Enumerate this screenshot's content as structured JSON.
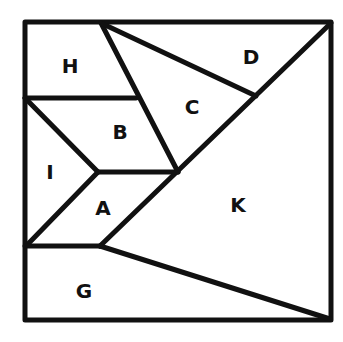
{
  "diagram": {
    "type": "dissection-puzzle",
    "colors": {
      "line": "#111111",
      "background": "#ffffff"
    },
    "regions": [
      {
        "id": "H",
        "label": "H",
        "x": 70,
        "y": 74
      },
      {
        "id": "D",
        "label": "D",
        "x": 251,
        "y": 64
      },
      {
        "id": "C",
        "label": "C",
        "x": 192,
        "y": 115
      },
      {
        "id": "B",
        "label": "B",
        "x": 120,
        "y": 139
      },
      {
        "id": "I",
        "label": "I",
        "x": 49,
        "y": 179
      },
      {
        "id": "A",
        "label": "A",
        "x": 103,
        "y": 214
      },
      {
        "id": "K",
        "label": "K",
        "x": 238,
        "y": 212
      },
      {
        "id": "G",
        "label": "G",
        "x": 84,
        "y": 298
      }
    ]
  }
}
